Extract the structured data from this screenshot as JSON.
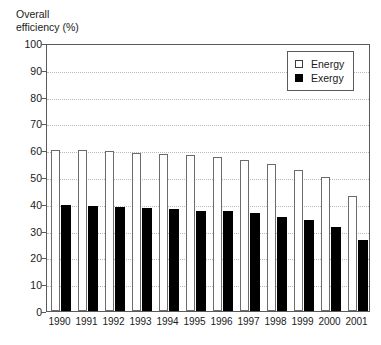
{
  "chart_data": {
    "type": "bar",
    "title": "Overall efficiency (%)",
    "title_lines": "Overall\nefficiency (%)",
    "xlabel": "",
    "ylabel": "Overall efficiency (%)",
    "ylim": [
      0,
      100
    ],
    "ytick_step": 10,
    "yticks": [
      0,
      10,
      20,
      30,
      40,
      50,
      60,
      70,
      80,
      90,
      100
    ],
    "ytick_labels": [
      "0",
      "10",
      "20",
      "30",
      "40",
      "50",
      "60",
      "70",
      "80",
      "90",
      "100"
    ],
    "categories": [
      "1990",
      "1991",
      "1992",
      "1993",
      "1994",
      "1995",
      "1996",
      "1997",
      "1998",
      "1999",
      "2000",
      "2001"
    ],
    "series": [
      {
        "name": "Energy",
        "color": "#ffffff",
        "edge_color": "#6b6b6b",
        "values": [
          60.0,
          60.0,
          59.8,
          59.0,
          58.5,
          58.2,
          57.5,
          56.3,
          55.0,
          52.8,
          50.0,
          43.0
        ]
      },
      {
        "name": "Exergy",
        "color": "#000000",
        "edge_color": "#000000",
        "values": [
          39.5,
          39.3,
          38.8,
          38.4,
          38.0,
          37.5,
          37.2,
          36.5,
          35.2,
          34.0,
          31.2,
          26.5
        ]
      }
    ],
    "grid": true,
    "grid_style": "dotted",
    "grid_color": "#b9b9b9",
    "legend_position": "upper right",
    "legend_entries": [
      "Energy",
      "Exergy"
    ]
  }
}
